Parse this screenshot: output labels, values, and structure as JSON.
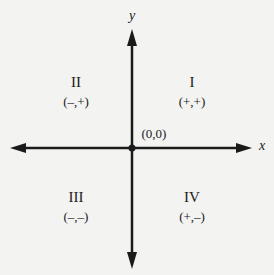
{
  "diagram": {
    "axes": {
      "x_label": "x",
      "y_label": "y"
    },
    "origin_label": "(0,0)",
    "quadrants": [
      {
        "numeral": "I",
        "signs": "(+,+)"
      },
      {
        "numeral": "II",
        "signs": "(–,+)"
      },
      {
        "numeral": "III",
        "signs": "(–,–)"
      },
      {
        "numeral": "IV",
        "signs": "(+,–)"
      }
    ],
    "colors": {
      "ink": "#1a1a1a",
      "background": "#f3f3f1"
    }
  }
}
